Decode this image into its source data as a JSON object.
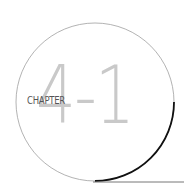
{
  "chapter": {
    "label": "CHAPTER",
    "number": "4-1"
  },
  "colors": {
    "circle_stroke": "#9a9a9a",
    "accent_arc": "#111111",
    "number_fill": "#c9c9c9",
    "label_text": "#555555"
  }
}
